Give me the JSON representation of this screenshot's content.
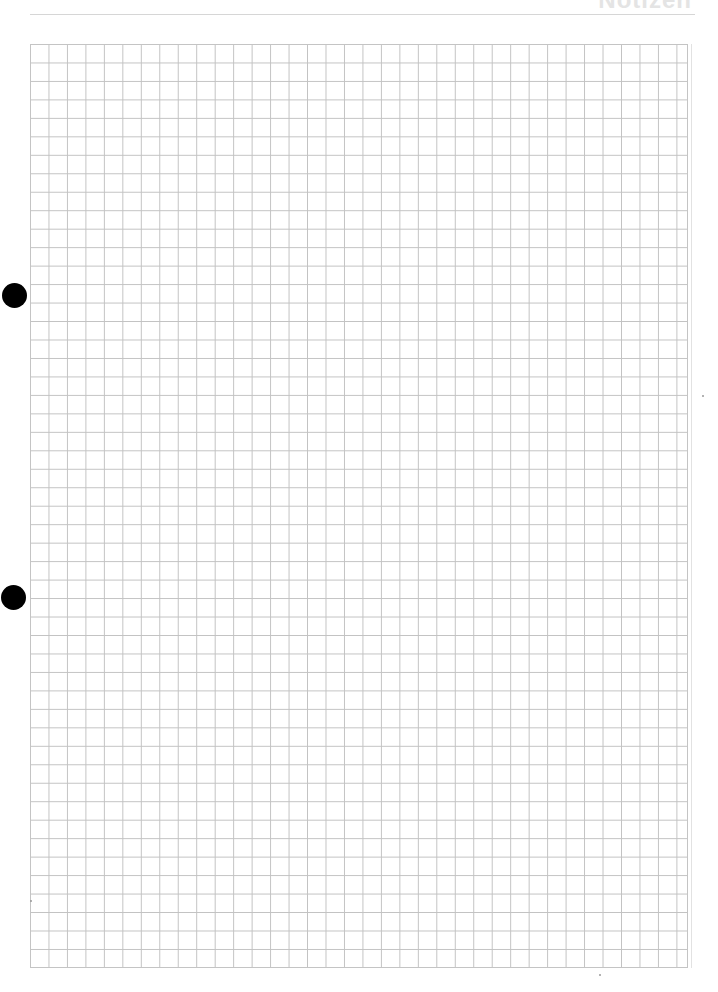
{
  "page": {
    "header": {
      "title": "Notizen"
    },
    "grid": {
      "type": "square-grid",
      "line_color": "#c2c2c2",
      "columns": 36,
      "rows": 50
    },
    "punch_holes": [
      {
        "label": "punch-hole-top",
        "color": "#000000"
      },
      {
        "label": "punch-hole-bottom",
        "color": "#000000"
      }
    ]
  }
}
